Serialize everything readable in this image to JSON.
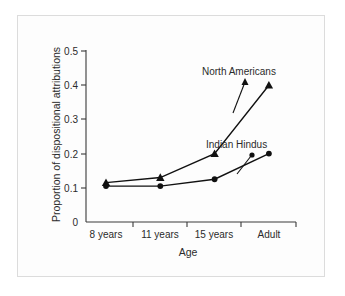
{
  "chart_data": {
    "type": "line",
    "title": "",
    "xlabel": "Age",
    "ylabel": "Proportion of dispositional attributions",
    "categories": [
      "8 years",
      "11 years",
      "15 years",
      "Adult"
    ],
    "ylim": [
      0,
      0.5
    ],
    "yticks": [
      "0",
      "0.1",
      "0.2",
      "0.3",
      "0.4",
      "0.5"
    ],
    "ytick_values": [
      0,
      0.1,
      0.2,
      0.3,
      0.4,
      0.5
    ],
    "grid": false,
    "legend_position": "inline-annotations",
    "series": [
      {
        "name": "North Americans",
        "marker": "triangle",
        "values": [
          0.115,
          0.13,
          0.2,
          0.4
        ]
      },
      {
        "name": "Indian Hindus",
        "marker": "circle",
        "values": [
          0.105,
          0.105,
          0.125,
          0.2
        ]
      }
    ],
    "annotations": [
      {
        "text": "North Americans",
        "target_category": "Adult"
      },
      {
        "text": "Indian Hindus",
        "target_category": "Adult"
      }
    ],
    "colors": {
      "line": "#111111",
      "axis": "#3a3a3a",
      "text": "#2b2b2b",
      "background": "#fdfdfd",
      "frame": "#dcdcdc"
    }
  },
  "axes": {
    "y_title": "Proportion of dispositional attributions",
    "x_title": "Age",
    "y_ticks": [
      {
        "label": "0.5"
      },
      {
        "label": "0.4"
      },
      {
        "label": "0.3"
      },
      {
        "label": "0.2"
      },
      {
        "label": "0.1"
      },
      {
        "label": "0"
      }
    ],
    "x_ticks": [
      {
        "label": "8 years"
      },
      {
        "label": "11 years"
      },
      {
        "label": "15 years"
      },
      {
        "label": "Adult"
      }
    ]
  },
  "labels": {
    "north_americans": "North Americans",
    "indian_hindus": "Indian Hindus"
  }
}
